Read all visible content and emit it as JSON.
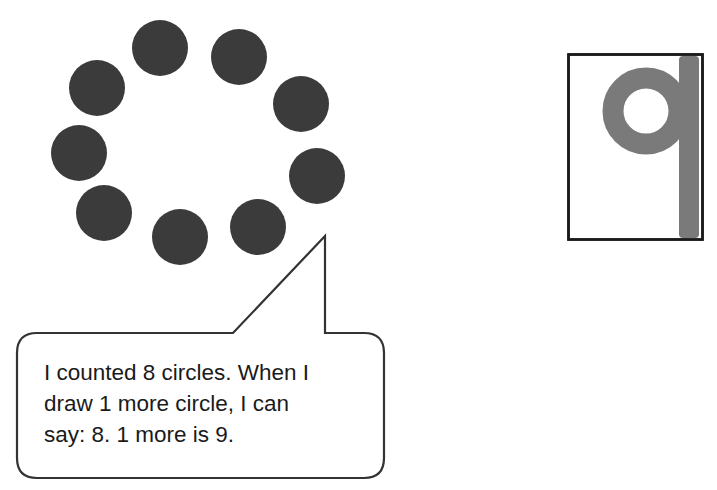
{
  "diagram": {
    "circles": {
      "count": 8,
      "fill": "#3b3b3b",
      "radius": 28,
      "positions": [
        {
          "x": 160,
          "y": 48
        },
        {
          "x": 239,
          "y": 57
        },
        {
          "x": 97,
          "y": 88
        },
        {
          "x": 301,
          "y": 104
        },
        {
          "x": 79,
          "y": 153
        },
        {
          "x": 317,
          "y": 176
        },
        {
          "x": 104,
          "y": 213
        },
        {
          "x": 258,
          "y": 227
        },
        {
          "x": 180,
          "y": 237
        }
      ]
    },
    "speech_bubble": {
      "lines": [
        "I counted 8 circles.  When I",
        "draw 1 more circle, I can",
        "say:  8.  1 more is 9."
      ]
    },
    "numeral_card": {
      "digit": "9",
      "digit_color": "#7a7a7a",
      "border_color": "#1a1a1a"
    }
  }
}
